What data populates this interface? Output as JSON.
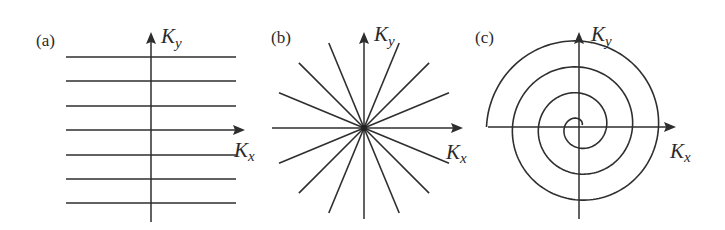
{
  "figure": {
    "colors": {
      "ink": "#2e2e2e",
      "background": "#ffffff"
    },
    "panels": [
      {
        "id": "a",
        "label": "(a)",
        "type": "cartesian-lines",
        "axis_x": {
          "label": "K",
          "subscript": "x"
        },
        "axis_y": {
          "label": "K",
          "subscript": "y"
        },
        "line_count": 7,
        "line_y": [
          57,
          81,
          106,
          130,
          155,
          179,
          203
        ],
        "line_x_range": [
          66,
          236
        ]
      },
      {
        "id": "b",
        "label": "(b)",
        "type": "radial-lines",
        "axis_x": {
          "label": "K",
          "subscript": "x"
        },
        "axis_y": {
          "label": "K",
          "subscript": "y"
        },
        "spoke_count": 16,
        "spoke_angle_step_deg": 22.5,
        "spoke_length": 92
      },
      {
        "id": "c",
        "label": "(c)",
        "type": "spiral",
        "axis_x": {
          "label": "K",
          "subscript": "x"
        },
        "axis_y": {
          "label": "K",
          "subscript": "y"
        },
        "spiral_turns": 3.5,
        "spiral_outer_radius": 91
      }
    ]
  }
}
